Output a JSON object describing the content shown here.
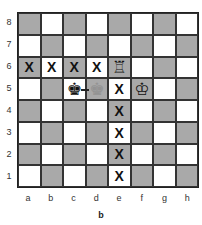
{
  "diagram": {
    "caption": "b",
    "files": [
      "a",
      "b",
      "c",
      "d",
      "e",
      "f",
      "g",
      "h"
    ],
    "ranks": [
      "8",
      "7",
      "6",
      "5",
      "4",
      "3",
      "2",
      "1"
    ],
    "colors": {
      "light": "#ffffff",
      "dark": "#a9a9a9"
    },
    "pieces": [
      {
        "square": "e6",
        "type": "rook",
        "color": "white",
        "glyph": "♖"
      },
      {
        "square": "c5",
        "type": "king",
        "color": "black",
        "glyph": "♚"
      },
      {
        "square": "d5",
        "type": "king",
        "color": "ghost",
        "glyph": "♚"
      },
      {
        "square": "f5",
        "type": "king",
        "color": "white",
        "glyph": "♔"
      }
    ],
    "marks": {
      "glyph": "X",
      "squares": [
        "a6",
        "b6",
        "c6",
        "d6",
        "e5",
        "e4",
        "e3",
        "e2",
        "e1"
      ]
    },
    "arrows": [
      {
        "from": "c5",
        "to": "d5"
      }
    ]
  }
}
